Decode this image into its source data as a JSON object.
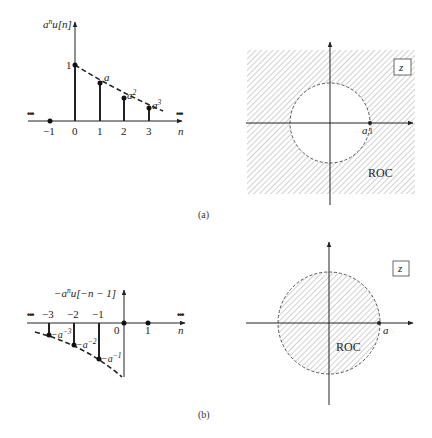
{
  "panel_a": {
    "caption": "(a)",
    "sequence": {
      "ylabel_base": "a",
      "ylabel_sup": "n",
      "ylabel_rest": "u[n]",
      "xlabel": "n",
      "ellipsis_left": "•••",
      "ellipsis_right": "•••",
      "ticks": [
        "−1",
        "0",
        "1",
        "2",
        "3"
      ],
      "value_labels": {
        "v0": "1",
        "v1": "a",
        "v2_base": "a",
        "v2_sup": "2",
        "v3_base": "a",
        "v3_sup": "3"
      }
    },
    "zplane": {
      "plane_label": "z",
      "pole_label": "a",
      "pole_tick": "1",
      "roc_label": "ROC",
      "roc_type": "outside circle |z| > |a|"
    }
  },
  "panel_b": {
    "caption": "(b)",
    "sequence": {
      "ylabel_prefix": "−a",
      "ylabel_sup": "n",
      "ylabel_rest": "u[−n − 1]",
      "xlabel": "n",
      "ellipsis_left": "•••",
      "ellipsis_right": "•••",
      "ticks": [
        "−3",
        "−2",
        "−1",
        "0",
        "1"
      ],
      "value_labels": {
        "vm3_base": "−a",
        "vm3_sup": "−3",
        "vm2_base": "−a",
        "vm2_sup": "−2",
        "vm1_base": "−a",
        "vm1_sup": "−1"
      }
    },
    "zplane": {
      "plane_label": "z",
      "pole_label": "a",
      "roc_label": "ROC",
      "roc_type": "inside circle |z| < |a|"
    }
  }
}
